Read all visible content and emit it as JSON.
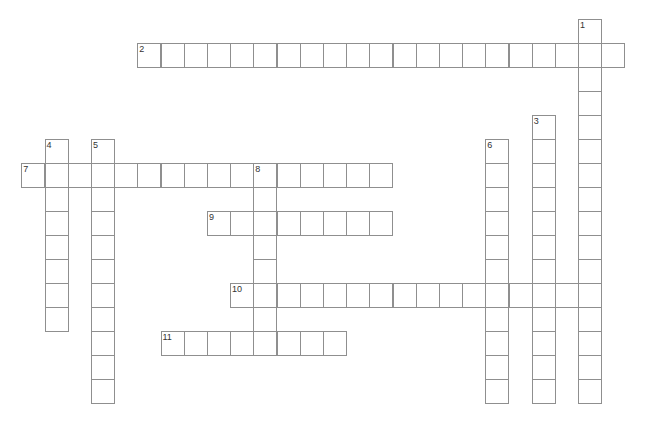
{
  "puzzle": {
    "type": "crossword",
    "grid": {
      "origin_x": 21.3,
      "origin_y": 19.3,
      "cell_width": 23.2,
      "cell_height": 24,
      "line_color": "#8f8f8f",
      "number_color": "#333333",
      "cell_fill": "#ffffff"
    },
    "words": [
      {
        "number": "1",
        "direction": "down",
        "col": 24,
        "row": 0,
        "length": 16
      },
      {
        "number": "2",
        "direction": "across",
        "col": 5,
        "row": 1,
        "length": 21
      },
      {
        "number": "3",
        "direction": "down",
        "col": 22,
        "row": 4,
        "length": 12
      },
      {
        "number": "4",
        "direction": "down",
        "col": 1,
        "row": 5,
        "length": 8
      },
      {
        "number": "5",
        "direction": "down",
        "col": 3,
        "row": 5,
        "length": 11
      },
      {
        "number": "6",
        "direction": "down",
        "col": 20,
        "row": 5,
        "length": 11
      },
      {
        "number": "7",
        "direction": "across",
        "col": 0,
        "row": 6,
        "length": 16
      },
      {
        "number": "8",
        "direction": "down",
        "col": 10,
        "row": 6,
        "length": 8
      },
      {
        "number": "9",
        "direction": "across",
        "col": 8,
        "row": 8,
        "length": 8
      },
      {
        "number": "10",
        "direction": "across",
        "col": 9,
        "row": 11,
        "length": 16
      },
      {
        "number": "11",
        "direction": "across",
        "col": 6,
        "row": 13,
        "length": 8
      }
    ]
  }
}
